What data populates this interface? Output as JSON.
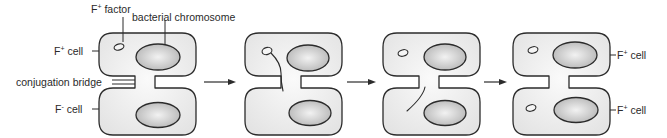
{
  "diagram": {
    "labels": {
      "f_factor": {
        "base": "F",
        "sup": "+",
        "rest": " factor"
      },
      "bacterial_chromosome": "bacterial chromosome",
      "f_plus_cell_left": {
        "base": "F",
        "sup": "+",
        "rest": " cell"
      },
      "conjugation_bridge": "conjugation bridge",
      "f_minus_cell_left": {
        "base": "F",
        "sup": "-",
        "rest": " cell"
      },
      "f_plus_cell_right_top": {
        "base": "F",
        "sup": "+",
        "rest": " cell"
      },
      "f_plus_cell_right_bottom": {
        "base": "F",
        "sup": "+",
        "rest": " cell"
      }
    },
    "panels": [
      {
        "step": 1,
        "description": "F+ cell with F factor joined to F- cell by conjugation bridge",
        "x": 99
      },
      {
        "step": 2,
        "description": "F factor strand begins transferring across bridge",
        "x": 245
      },
      {
        "step": 3,
        "description": "Single strand enters recipient cell",
        "x": 383
      },
      {
        "step": 4,
        "description": "Both cells now contain F factor (both F+)",
        "x": 513
      }
    ],
    "arrows": [
      {
        "from": 1,
        "to": 2
      },
      {
        "from": 2,
        "to": 3
      },
      {
        "from": 3,
        "to": 4
      }
    ],
    "colors": {
      "cell_fill": "#ececec",
      "chromosome_fill": "#c4c4c4",
      "stroke": "#2b2b2b",
      "text": "#2a2a2a"
    }
  }
}
